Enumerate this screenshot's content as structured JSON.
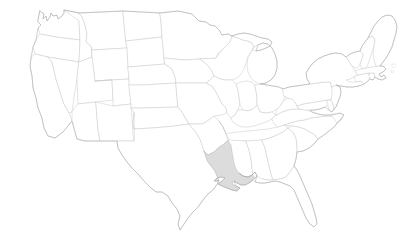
{
  "map": {
    "name": "united-states-map",
    "title": "United States",
    "projection": "albers-usa",
    "width": 407,
    "height": 238,
    "background_color": "#ffffff",
    "state_fill_color": "#ffffff",
    "state_border_color": "#c9c9c9",
    "outer_border_color": "#a8a8a8",
    "highlight_fill_color": "#dcdcdc",
    "highlight_border_color": "#b4b4b4",
    "highlighted_states": [
      "Louisiana"
    ],
    "labels_visible": false,
    "legend_visible": false,
    "title_visible": false,
    "states": [
      {
        "code": "WA",
        "name": "Washington",
        "highlighted": false
      },
      {
        "code": "OR",
        "name": "Oregon",
        "highlighted": false
      },
      {
        "code": "CA",
        "name": "California",
        "highlighted": false
      },
      {
        "code": "NV",
        "name": "Nevada",
        "highlighted": false
      },
      {
        "code": "ID",
        "name": "Idaho",
        "highlighted": false
      },
      {
        "code": "MT",
        "name": "Montana",
        "highlighted": false
      },
      {
        "code": "WY",
        "name": "Wyoming",
        "highlighted": false
      },
      {
        "code": "UT",
        "name": "Utah",
        "highlighted": false
      },
      {
        "code": "AZ",
        "name": "Arizona",
        "highlighted": false
      },
      {
        "code": "NM",
        "name": "New Mexico",
        "highlighted": false
      },
      {
        "code": "CO",
        "name": "Colorado",
        "highlighted": false
      },
      {
        "code": "ND",
        "name": "North Dakota",
        "highlighted": false
      },
      {
        "code": "SD",
        "name": "South Dakota",
        "highlighted": false
      },
      {
        "code": "NE",
        "name": "Nebraska",
        "highlighted": false
      },
      {
        "code": "KS",
        "name": "Kansas",
        "highlighted": false
      },
      {
        "code": "OK",
        "name": "Oklahoma",
        "highlighted": false
      },
      {
        "code": "TX",
        "name": "Texas",
        "highlighted": false
      },
      {
        "code": "MN",
        "name": "Minnesota",
        "highlighted": false
      },
      {
        "code": "IA",
        "name": "Iowa",
        "highlighted": false
      },
      {
        "code": "MO",
        "name": "Missouri",
        "highlighted": false
      },
      {
        "code": "AR",
        "name": "Arkansas",
        "highlighted": false
      },
      {
        "code": "LA",
        "name": "Louisiana",
        "highlighted": true
      },
      {
        "code": "WI",
        "name": "Wisconsin",
        "highlighted": false
      },
      {
        "code": "IL",
        "name": "Illinois",
        "highlighted": false
      },
      {
        "code": "MI",
        "name": "Michigan",
        "highlighted": false
      },
      {
        "code": "IN",
        "name": "Indiana",
        "highlighted": false
      },
      {
        "code": "OH",
        "name": "Ohio",
        "highlighted": false
      },
      {
        "code": "KY",
        "name": "Kentucky",
        "highlighted": false
      },
      {
        "code": "TN",
        "name": "Tennessee",
        "highlighted": false
      },
      {
        "code": "MS",
        "name": "Mississippi",
        "highlighted": false
      },
      {
        "code": "AL",
        "name": "Alabama",
        "highlighted": false
      },
      {
        "code": "GA",
        "name": "Georgia",
        "highlighted": false
      },
      {
        "code": "FL",
        "name": "Florida",
        "highlighted": false
      },
      {
        "code": "SC",
        "name": "South Carolina",
        "highlighted": false
      },
      {
        "code": "NC",
        "name": "North Carolina",
        "highlighted": false
      },
      {
        "code": "VA",
        "name": "Virginia",
        "highlighted": false
      },
      {
        "code": "WV",
        "name": "West Virginia",
        "highlighted": false
      },
      {
        "code": "MD",
        "name": "Maryland",
        "highlighted": false
      },
      {
        "code": "DE",
        "name": "Delaware",
        "highlighted": false
      },
      {
        "code": "PA",
        "name": "Pennsylvania",
        "highlighted": false
      },
      {
        "code": "NJ",
        "name": "New Jersey",
        "highlighted": false
      },
      {
        "code": "NY",
        "name": "New York",
        "highlighted": false
      },
      {
        "code": "CT",
        "name": "Connecticut",
        "highlighted": false
      },
      {
        "code": "RI",
        "name": "Rhode Island",
        "highlighted": false
      },
      {
        "code": "MA",
        "name": "Massachusetts",
        "highlighted": false
      },
      {
        "code": "VT",
        "name": "Vermont",
        "highlighted": false
      },
      {
        "code": "NH",
        "name": "New Hampshire",
        "highlighted": false
      },
      {
        "code": "ME",
        "name": "Maine",
        "highlighted": false
      }
    ]
  }
}
